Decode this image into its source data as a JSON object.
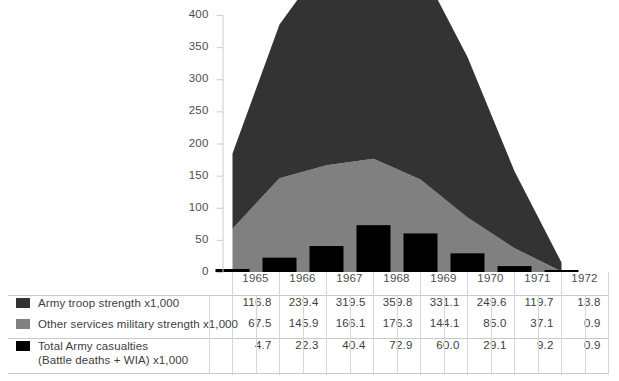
{
  "chart_data": {
    "type": "area",
    "title": "",
    "xlabel": "",
    "ylabel": "",
    "categories": [
      "1965",
      "1966",
      "1967",
      "1968",
      "1969",
      "1970",
      "1971",
      "1972"
    ],
    "ylim": [
      0,
      400
    ],
    "yticks": [
      0,
      50,
      100,
      150,
      200,
      250,
      300,
      350,
      400
    ],
    "grid": false,
    "legend_position": "table-left",
    "series": [
      {
        "name": "Army troop strength x1,000",
        "type": "area-stacked",
        "color": "#333333",
        "values": [
          116.8,
          239.4,
          319.5,
          359.8,
          331.1,
          249.6,
          119.7,
          13.8
        ]
      },
      {
        "name": "Other services military strength x1,000",
        "type": "area-stacked",
        "color": "#808080",
        "values": [
          67.5,
          145.9,
          166.1,
          176.3,
          144.1,
          85.0,
          37.1,
          0.9
        ]
      },
      {
        "name": "Total Army casualties (Battle deaths + WIA) x1,000",
        "type": "bar",
        "color": "#000000",
        "values": [
          4.7,
          22.3,
          40.4,
          72.9,
          60.0,
          29.1,
          9.2,
          0.9
        ]
      }
    ]
  },
  "axis": {
    "ytick_labels": [
      "400",
      "350",
      "300",
      "250",
      "200",
      "150",
      "100",
      "50",
      "0"
    ]
  },
  "table": {
    "header_years": [
      "1965",
      "1966",
      "1967",
      "1968",
      "1969",
      "1970",
      "1971",
      "1972"
    ],
    "rows": [
      {
        "swatch_color": "#333333",
        "label": "Army troop strength x1,000",
        "label_line2": "",
        "values": [
          "116.8",
          "239.4",
          "319.5",
          "359.8",
          "331.1",
          "249.6",
          "119.7",
          "13.8"
        ]
      },
      {
        "swatch_color": "#808080",
        "label": "Other services military strength x1,000",
        "label_line2": "",
        "values": [
          "67.5",
          "145.9",
          "166.1",
          "176.3",
          "144.1",
          "85.0",
          "37.1",
          "0.9"
        ]
      },
      {
        "swatch_color": "#000000",
        "label": "Total Army casualties",
        "label_line2": "(Battle deaths + WIA) x1,000",
        "values": [
          "4.7",
          "22.3",
          "40.4",
          "72.9",
          "60.0",
          "29.1",
          "9.2",
          "0.9"
        ]
      }
    ]
  }
}
